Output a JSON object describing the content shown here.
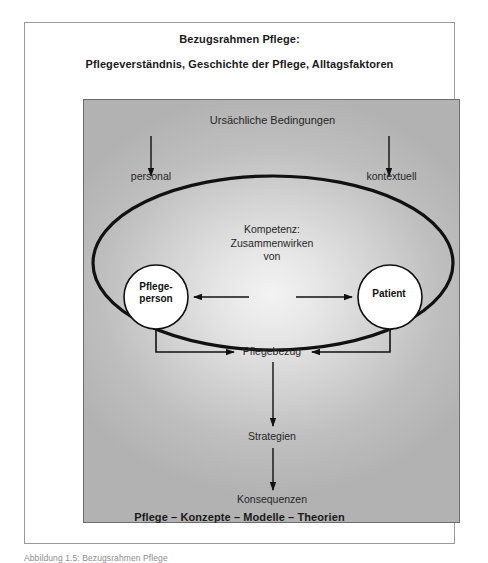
{
  "figure": {
    "title_line_1": "Bezugsrahmen Pflege:",
    "title_line_2": "Pflegeverständnis, Geschichte der Pflege, Alltagsfaktoren",
    "footer": "Pflege – Konzepte – Modelle – Theorien",
    "external_caption": "Abbildung 1.5: Bezugsrahmen Pflege"
  },
  "diagram": {
    "causal_conditions": "Ursächliche Bedingungen",
    "condition_left": "personal",
    "condition_right": "kontextuell",
    "competence_line_1": "Kompetenz:",
    "competence_line_2": "Zusammenwirken",
    "competence_line_3": "von",
    "node_left_line_1": "Pflege-",
    "node_left_line_2": "person",
    "node_right": "Patient",
    "relation": "Pflegebezug",
    "strategies": "Strategien",
    "consequences": "Konsequenzen"
  },
  "colors": {
    "frame_border": "#9a9a9a",
    "panel_border": "#6d6d6d",
    "stroke": "#111111",
    "text": "#262626",
    "panel_light": "#f3f3f3",
    "panel_dark": "#b2b2b2"
  }
}
